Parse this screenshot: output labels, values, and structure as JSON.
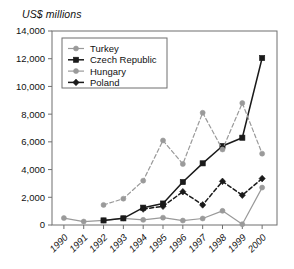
{
  "axis_title": "US$ millions",
  "chart_data": {
    "type": "line",
    "title": "",
    "subtitle": "",
    "xlabel": "",
    "ylabel": "US$ millions",
    "ylim": [
      0,
      14000
    ],
    "ytick_labels": [
      "0",
      "2,000",
      "4,000",
      "6,000",
      "8,000",
      "10,000",
      "12,000",
      "14,000"
    ],
    "ytick_values": [
      0,
      2000,
      4000,
      6000,
      8000,
      10000,
      12000,
      14000
    ],
    "grid": false,
    "legend_position": "top-left",
    "categories": [
      "1990",
      "1991",
      "1992",
      "1993",
      "1994",
      "1995",
      "1996",
      "1997",
      "1998",
      "1999",
      "2000"
    ],
    "x": [
      1990,
      1991,
      1992,
      1993,
      1994,
      1995,
      1996,
      1997,
      1998,
      1999,
      2000
    ],
    "series": [
      {
        "name": "Turkey",
        "color": "#9a9a9a",
        "line_style": "solid",
        "marker": "circle",
        "values": [
          500,
          250,
          330,
          480,
          370,
          530,
          320,
          470,
          1020,
          60,
          2700
        ]
      },
      {
        "name": "Czech Republic",
        "color": "#1a1a1a",
        "line_style": "solid",
        "marker": "square",
        "values": [
          null,
          null,
          330,
          480,
          1250,
          1550,
          3100,
          4450,
          5700,
          6300,
          12050
        ]
      },
      {
        "name": "Hungary",
        "color": "#9a9a9a",
        "line_style": "dashed",
        "marker": "circle",
        "values": [
          null,
          null,
          1450,
          1900,
          3200,
          6100,
          4400,
          8100,
          5450,
          8800,
          5150
        ]
      },
      {
        "name": "Poland",
        "color": "#1a1a1a",
        "line_style": "dashed",
        "marker": "diamond",
        "values": [
          null,
          null,
          null,
          null,
          1150,
          1350,
          2400,
          1450,
          3150,
          2150,
          3350
        ]
      }
    ]
  },
  "legend": {
    "entries": [
      {
        "label": "Turkey"
      },
      {
        "label": "Czech Republic"
      },
      {
        "label": "Hungary"
      },
      {
        "label": "Poland"
      }
    ]
  }
}
